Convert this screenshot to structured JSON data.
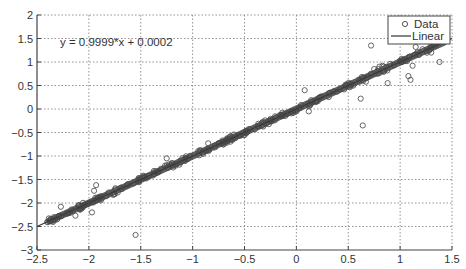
{
  "chart_data": {
    "type": "scatter",
    "title": "",
    "xlabel": "",
    "ylabel": "",
    "xlim": [
      -2.5,
      1.5
    ],
    "ylim": [
      -3,
      2
    ],
    "grid": true,
    "legend_position": "upper right",
    "x_ticks": [
      "-2.5",
      "-2",
      "-1.5",
      "-1",
      "-0.5",
      "0",
      "0.5",
      "1",
      "1.5"
    ],
    "y_ticks": [
      "-3",
      "-2.5",
      "-2",
      "-1.5",
      "-1",
      "-0.5",
      "0",
      "0.5",
      "1",
      "1.5",
      "2"
    ],
    "annotation": "y = 0.9999*x + 0.0002",
    "series": [
      {
        "name": "Data",
        "marker": "circle",
        "note": "dense cluster along y=x from x≈-2.4 to x≈1.4 plus scattered outliers",
        "outliers": [
          {
            "x": -2.27,
            "y": -2.08
          },
          {
            "x": -2.13,
            "y": -2.27
          },
          {
            "x": -1.97,
            "y": -2.2
          },
          {
            "x": -1.95,
            "y": -1.74
          },
          {
            "x": -1.93,
            "y": -1.62
          },
          {
            "x": -1.55,
            "y": -2.68
          },
          {
            "x": -1.52,
            "y": -1.47
          },
          {
            "x": -1.25,
            "y": -1.05
          },
          {
            "x": -1.12,
            "y": -1.1
          },
          {
            "x": -0.85,
            "y": -0.73
          },
          {
            "x": -0.62,
            "y": -0.62
          },
          {
            "x": -0.33,
            "y": -0.3
          },
          {
            "x": 0.08,
            "y": 0.4
          },
          {
            "x": 0.12,
            "y": -0.05
          },
          {
            "x": 0.3,
            "y": 0.28
          },
          {
            "x": 0.62,
            "y": 0.22
          },
          {
            "x": 0.64,
            "y": -0.35
          },
          {
            "x": 0.67,
            "y": 0.58
          },
          {
            "x": 0.72,
            "y": 1.35
          },
          {
            "x": 0.75,
            "y": 0.85
          },
          {
            "x": 0.78,
            "y": 0.75
          },
          {
            "x": 0.8,
            "y": 0.9
          },
          {
            "x": 0.83,
            "y": 0.92
          },
          {
            "x": 0.88,
            "y": 0.55
          },
          {
            "x": 1.08,
            "y": 0.7
          },
          {
            "x": 1.1,
            "y": 0.62
          },
          {
            "x": 1.12,
            "y": 0.92
          },
          {
            "x": 1.15,
            "y": 1.32
          },
          {
            "x": 1.3,
            "y": 1.2
          },
          {
            "x": 1.38,
            "y": 1.0
          }
        ]
      },
      {
        "name": "Linear",
        "type": "line",
        "slope": 0.9999,
        "intercept": 0.0002,
        "x_range": [
          -2.4,
          1.45
        ]
      }
    ]
  },
  "legend": {
    "items": [
      {
        "label": "Data",
        "symbol": "o"
      },
      {
        "label": "Linear",
        "symbol": "line"
      }
    ]
  },
  "annotation_text": "y = 0.9999*x + 0.0002",
  "axes": {
    "x_tick_labels": [
      "−2.5",
      "−2",
      "−1.5",
      "−1",
      "−0.5",
      "0",
      "0.5",
      "1",
      "1.5"
    ],
    "y_tick_labels": [
      "−3",
      "−2.5",
      "−2",
      "−1.5",
      "−1",
      "−0.5",
      "0",
      "0.5",
      "1",
      "1.5",
      "2"
    ]
  },
  "colors": {
    "line": "#3a3a3a",
    "marker": "#555555",
    "grid": "#777777",
    "axis": "#444444"
  }
}
